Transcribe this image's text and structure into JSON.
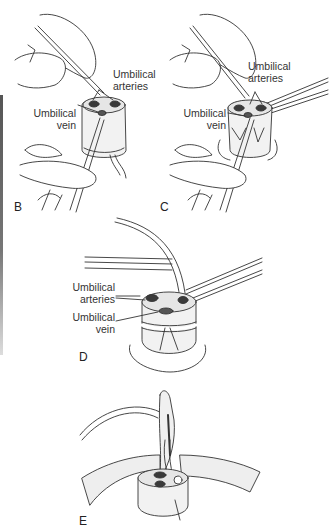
{
  "figure": {
    "panels": [
      {
        "id": "B",
        "letter": "B",
        "labels": {
          "arteries": "Umbilical\narteries",
          "vein": "Umbilical\nvein"
        }
      },
      {
        "id": "C",
        "letter": "C",
        "labels": {
          "arteries": "Umbilical\narteries",
          "vein": "Umbilical\nvein"
        }
      },
      {
        "id": "D",
        "letter": "D",
        "labels": {
          "arteries": "Umbilical\narteries",
          "vein": "Umbilical\nvein"
        }
      },
      {
        "id": "E",
        "letter": "E",
        "labels": {}
      }
    ],
    "colors": {
      "line": "#333333",
      "shade": "#d8d8d8",
      "fill": "#f2f2f2",
      "lumen": "#3a3a3a"
    }
  }
}
